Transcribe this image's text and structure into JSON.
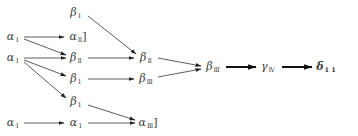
{
  "diagram": {
    "nodes": [
      {
        "id": "a1_r2",
        "base": "α",
        "sub": "1",
        "suffix": "",
        "x": 13,
        "y": 37
      },
      {
        "id": "a1_r3",
        "base": "α",
        "sub": "1",
        "suffix": "",
        "x": 13,
        "y": 58
      },
      {
        "id": "a1_r6",
        "base": "α",
        "sub": "1",
        "suffix": "",
        "x": 13,
        "y": 123
      },
      {
        "id": "b1_r1",
        "base": "β",
        "sub": "1",
        "suffix": "",
        "x": 76,
        "y": 13
      },
      {
        "id": "a2_r2",
        "base": "α",
        "sub": "Ⅱ",
        "suffix": "]",
        "x": 78,
        "y": 37
      },
      {
        "id": "b2_r3",
        "base": "β",
        "sub": "Ⅱ",
        "suffix": "",
        "x": 76,
        "y": 58
      },
      {
        "id": "b1_r4",
        "base": "β",
        "sub": "1",
        "suffix": "",
        "x": 76,
        "y": 79
      },
      {
        "id": "b1_r5",
        "base": "β",
        "sub": "1",
        "suffix": "",
        "x": 76,
        "y": 102
      },
      {
        "id": "a1_r6b",
        "base": "α",
        "sub": "1",
        "suffix": "",
        "x": 76,
        "y": 123
      },
      {
        "id": "b2_c3",
        "base": "β",
        "sub": "Ⅱ",
        "suffix": "",
        "x": 146,
        "y": 58
      },
      {
        "id": "b3_c3",
        "base": "β",
        "sub": "Ⅲ",
        "suffix": "",
        "x": 146,
        "y": 79
      },
      {
        "id": "a3_c3",
        "base": "α",
        "sub": "Ⅲ",
        "suffix": "]",
        "x": 148,
        "y": 123
      },
      {
        "id": "b3_c4",
        "base": "β",
        "sub": "Ⅲ",
        "suffix": "",
        "x": 213,
        "y": 67
      },
      {
        "id": "g4_c5",
        "base": "γ",
        "sub": "Ⅳ",
        "suffix": "",
        "x": 268,
        "y": 67
      },
      {
        "id": "d11_c6",
        "base": "δ",
        "sub": "1 1",
        "suffix": "",
        "x": 326,
        "y": 67,
        "bold": true
      }
    ],
    "edges": [
      {
        "from": [
          24,
          37
        ],
        "to": [
          64,
          37
        ],
        "weight": "thin"
      },
      {
        "from": [
          24,
          39
        ],
        "to": [
          66,
          55
        ],
        "weight": "thin"
      },
      {
        "from": [
          24,
          58
        ],
        "to": [
          66,
          58
        ],
        "weight": "thin"
      },
      {
        "from": [
          24,
          60
        ],
        "to": [
          66,
          76
        ],
        "weight": "thin"
      },
      {
        "from": [
          24,
          62
        ],
        "to": [
          66,
          98
        ],
        "weight": "thin"
      },
      {
        "from": [
          24,
          123
        ],
        "to": [
          64,
          123
        ],
        "weight": "thin"
      },
      {
        "from": [
          88,
          16
        ],
        "to": [
          136,
          54
        ],
        "weight": "thin"
      },
      {
        "from": [
          88,
          58
        ],
        "to": [
          134,
          58
        ],
        "weight": "thin"
      },
      {
        "from": [
          88,
          79
        ],
        "to": [
          134,
          79
        ],
        "weight": "thin"
      },
      {
        "from": [
          88,
          105
        ],
        "to": [
          135,
          120
        ],
        "weight": "thin"
      },
      {
        "from": [
          88,
          123
        ],
        "to": [
          135,
          123
        ],
        "weight": "thin"
      },
      {
        "from": [
          158,
          58
        ],
        "to": [
          201,
          66
        ],
        "weight": "thin"
      },
      {
        "from": [
          158,
          77
        ],
        "to": [
          201,
          69
        ],
        "weight": "thin"
      },
      {
        "from": [
          226,
          67
        ],
        "to": [
          256,
          67
        ],
        "weight": "thick"
      },
      {
        "from": [
          282,
          67
        ],
        "to": [
          312,
          67
        ],
        "weight": "thick"
      }
    ]
  }
}
